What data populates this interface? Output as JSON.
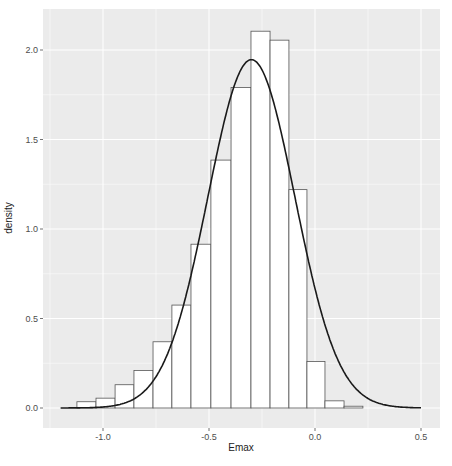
{
  "chart_data": {
    "type": "bar",
    "subtype": "histogram-with-density-curve",
    "title": "",
    "xlabel": "Emax",
    "ylabel": "density",
    "xlim": [
      -1.2,
      0.55
    ],
    "ylim": [
      0,
      2.2
    ],
    "x_ticks": [
      -1.0,
      -0.5,
      0.0,
      0.5
    ],
    "x_tick_labels": [
      "-1.0",
      "-0.5",
      "0.0",
      "0.5"
    ],
    "y_ticks": [
      0.0,
      0.5,
      1.0,
      1.5,
      2.0
    ],
    "y_tick_labels": [
      "0.0",
      "0.5",
      "1.0",
      "1.5",
      "2.0"
    ],
    "grid": true,
    "legend": null,
    "bin_width": 0.09,
    "bins": [
      {
        "x0": -1.123,
        "x1": -1.033,
        "density": 0.035
      },
      {
        "x0": -1.033,
        "x1": -0.943,
        "density": 0.055
      },
      {
        "x0": -0.943,
        "x1": -0.854,
        "density": 0.13
      },
      {
        "x0": -0.854,
        "x1": -0.764,
        "density": 0.21
      },
      {
        "x0": -0.764,
        "x1": -0.675,
        "density": 0.37
      },
      {
        "x0": -0.675,
        "x1": -0.585,
        "density": 0.575
      },
      {
        "x0": -0.585,
        "x1": -0.491,
        "density": 0.915
      },
      {
        "x0": -0.491,
        "x1": -0.396,
        "density": 1.385
      },
      {
        "x0": -0.396,
        "x1": -0.302,
        "density": 1.79
      },
      {
        "x0": -0.302,
        "x1": -0.212,
        "density": 2.105
      },
      {
        "x0": -0.212,
        "x1": -0.123,
        "density": 2.055
      },
      {
        "x0": -0.123,
        "x1": -0.038,
        "density": 1.22
      },
      {
        "x0": -0.038,
        "x1": 0.047,
        "density": 0.26
      },
      {
        "x0": 0.047,
        "x1": 0.137,
        "density": 0.04
      },
      {
        "x0": 0.137,
        "x1": 0.226,
        "density": 0.01
      }
    ],
    "series": [
      {
        "name": "normal density fit",
        "type": "line",
        "mean": -0.3,
        "sd": 0.205,
        "x_range": [
          -1.2,
          0.5
        ],
        "peak": 1.95
      }
    ]
  },
  "colors": {
    "panel_bg": "#ebebeb",
    "grid": "#ffffff",
    "bar_fill": "#ffffff",
    "bar_stroke": "#555555",
    "curve": "#1a1a1a",
    "tick": "#4d4d4d"
  }
}
